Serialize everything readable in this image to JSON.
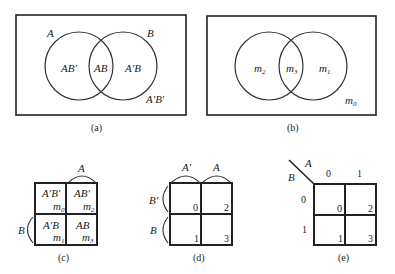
{
  "panels": {
    "a": {
      "caption": "(a)",
      "set_a_label": "A",
      "set_b_label": "B",
      "regions": {
        "a_only": "AB′",
        "both": "AB",
        "b_only": "A′B",
        "outside": "A′B′"
      }
    },
    "b": {
      "caption": "(b)",
      "regions": {
        "a_only": {
          "base": "m",
          "sub": "2"
        },
        "both": {
          "base": "m",
          "sub": "3"
        },
        "b_only": {
          "base": "m",
          "sub": "1"
        },
        "outside": {
          "base": "m",
          "sub": "0"
        }
      }
    },
    "c": {
      "caption": "(c)",
      "col_label": "A",
      "row_label": "B",
      "cells": [
        {
          "term": "A′B′",
          "m": "m",
          "sub": "0"
        },
        {
          "term": "AB′",
          "m": "m",
          "sub": "2"
        },
        {
          "term": "A′B",
          "m": "m",
          "sub": "1"
        },
        {
          "term": "AB",
          "m": "m",
          "sub": "3"
        }
      ]
    },
    "d": {
      "caption": "(d)",
      "col_labels": [
        "A′",
        "A"
      ],
      "row_labels": [
        "B′",
        "B"
      ],
      "cells": [
        "0",
        "2",
        "1",
        "3"
      ]
    },
    "e": {
      "caption": "(e)",
      "corner_a": "A",
      "corner_b": "B",
      "col_values": [
        "0",
        "1"
      ],
      "row_values": [
        "0",
        "1"
      ],
      "cells": [
        "0",
        "2",
        "1",
        "3"
      ]
    }
  }
}
